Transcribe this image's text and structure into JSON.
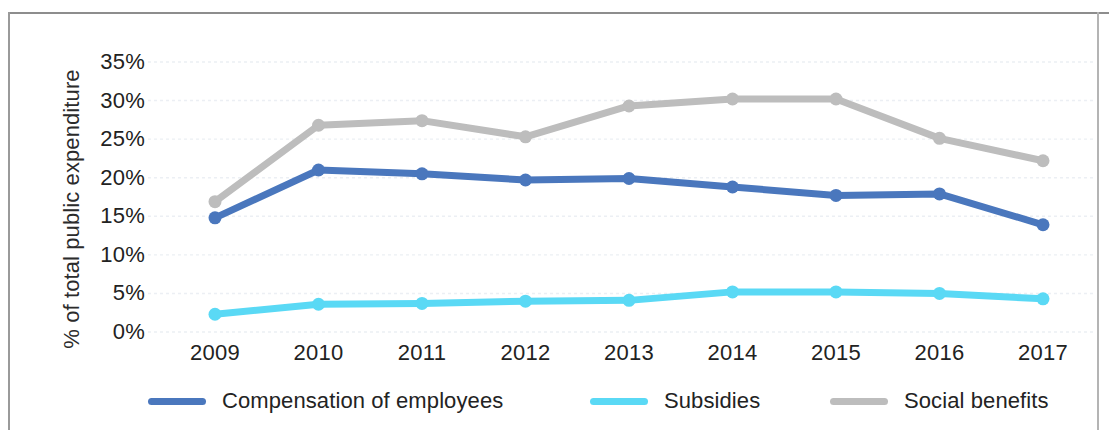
{
  "chart_data": {
    "type": "line",
    "title": "",
    "xlabel": "",
    "ylabel": "% of total public expenditure",
    "categories": [
      "2009",
      "2010",
      "2011",
      "2012",
      "2013",
      "2014",
      "2015",
      "2016",
      "2017"
    ],
    "ylim": [
      0,
      35
    ],
    "ytick_labels": [
      "0%",
      "5%",
      "10%",
      "15%",
      "20%",
      "25%",
      "30%",
      "35%"
    ],
    "ytick_values": [
      0,
      5,
      10,
      15,
      20,
      25,
      30,
      35
    ],
    "grid": true,
    "legend_position": "bottom",
    "series": [
      {
        "name": "Compensation of employees",
        "color": "#4a77bd",
        "values": [
          14.8,
          21.0,
          20.5,
          19.7,
          19.9,
          18.8,
          17.7,
          17.9,
          13.9
        ]
      },
      {
        "name": "Subsidies",
        "color": "#5ad9f5",
        "values": [
          2.3,
          3.6,
          3.7,
          4.0,
          4.1,
          5.2,
          5.2,
          5.0,
          4.3
        ]
      },
      {
        "name": "Social benefits",
        "color": "#bdbdbd",
        "values": [
          16.9,
          26.8,
          27.4,
          25.3,
          29.3,
          30.2,
          30.2,
          25.1,
          22.2
        ]
      }
    ]
  },
  "axis": {
    "y_title": "% of total public expenditure"
  },
  "legend": {
    "items": [
      {
        "label": "Compensation of employees",
        "color": "#4a77bd"
      },
      {
        "label": "Subsidies",
        "color": "#5ad9f5"
      },
      {
        "label": "Social benefits",
        "color": "#bdbdbd"
      }
    ]
  },
  "colors": {
    "compensation": "#4a77bd",
    "subsidies": "#5ad9f5",
    "social_benefits": "#bdbdbd",
    "gridline": "#eceff4",
    "text": "#222222",
    "frame": "#9a9a9a"
  }
}
